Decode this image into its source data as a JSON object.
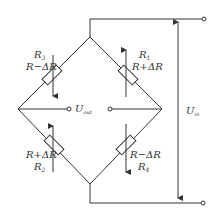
{
  "diagram": {
    "type": "wheatstone-bridge",
    "colors": {
      "line": "#333333",
      "background": "#ffffff"
    },
    "resistors": [
      {
        "id": "R3",
        "name": "R",
        "sub": "3",
        "value": "R−ΔR",
        "position": "top-left",
        "arrow": "down"
      },
      {
        "id": "R1",
        "name": "R",
        "sub": "1",
        "value": "R+ΔR",
        "position": "top-right",
        "arrow": "up"
      },
      {
        "id": "R2",
        "name": "R",
        "sub": "2",
        "value": "R+ΔR",
        "position": "bottom-left",
        "arrow": "up"
      },
      {
        "id": "R4",
        "name": "R",
        "sub": "4",
        "value": "R−ΔR",
        "position": "bottom-right",
        "arrow": "down"
      }
    ],
    "output": {
      "name": "U",
      "sub": "out"
    },
    "input": {
      "name": "U",
      "sub": "in"
    }
  }
}
